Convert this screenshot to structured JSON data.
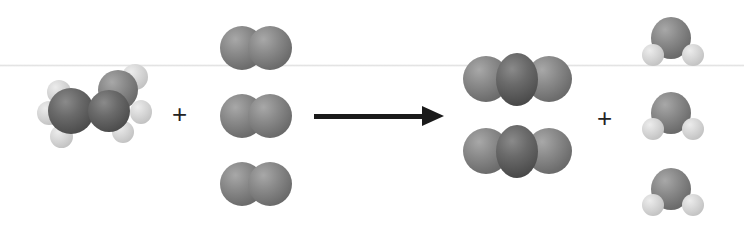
{
  "diagram": {
    "type": "chemical-reaction-space-filling-models",
    "reactants": [
      {
        "name": "ethanol",
        "count": 1,
        "atoms": {
          "C": 2,
          "O": 1,
          "H": 6
        }
      },
      {
        "name": "oxygen",
        "count": 3,
        "atoms": {
          "O": 2
        }
      }
    ],
    "products": [
      {
        "name": "carbon-dioxide",
        "count": 2,
        "atoms": {
          "C": 1,
          "O": 2
        }
      },
      {
        "name": "water",
        "count": 3,
        "atoms": {
          "O": 1,
          "H": 2
        }
      }
    ],
    "operators": {
      "plus_1": "+",
      "plus_2": "+"
    },
    "colors": {
      "background": "#ffffff",
      "carbon": "#4d4d4d",
      "oxygen": "#7a7a7a",
      "hydrogen": "#d4d4d4",
      "arrow": "#1a1a1a"
    }
  }
}
